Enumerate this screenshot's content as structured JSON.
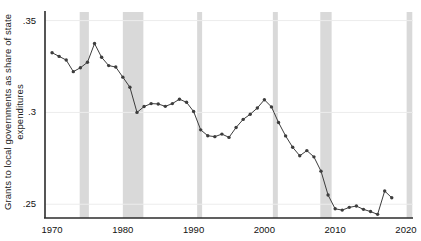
{
  "chart_data": {
    "type": "line",
    "title": "",
    "subtitle": "",
    "xlabel": "",
    "ylabel": "Grants to local governments as share of state expenditures",
    "xlim": [
      1969,
      2021
    ],
    "ylim": [
      0.2425,
      0.3525
    ],
    "grid": true,
    "legend_position": "none",
    "marker": "filled-circle",
    "line_style": "solid",
    "series_color": "#3d3d3d",
    "recession_band_color": "#d9d9d9",
    "xticks": [
      "1970",
      "1980",
      "1990",
      "2000",
      "2010",
      "2020"
    ],
    "xtick_values": [
      1970,
      1980,
      1990,
      2000,
      2010,
      2020
    ],
    "yticks": [
      ".35",
      ".3",
      ".25"
    ],
    "ytick_values": [
      0.35,
      0.3,
      0.25
    ],
    "x": [
      1970,
      1971,
      1972,
      1973,
      1974,
      1975,
      1976,
      1977,
      1978,
      1979,
      1980,
      1981,
      1982,
      1983,
      1984,
      1985,
      1986,
      1987,
      1988,
      1989,
      1990,
      1991,
      1992,
      1993,
      1994,
      1995,
      1996,
      1997,
      1998,
      1999,
      2000,
      2001,
      2002,
      2003,
      2004,
      2005,
      2006,
      2007,
      2008,
      2009,
      2010,
      2011,
      2012,
      2013,
      2014,
      2015,
      2016,
      2017,
      2018
    ],
    "values": [
      0.3325,
      0.3305,
      0.3285,
      0.3222,
      0.3243,
      0.3273,
      0.3375,
      0.33,
      0.3255,
      0.3247,
      0.3192,
      0.3137,
      0.3,
      0.3032,
      0.3048,
      0.3046,
      0.3033,
      0.3048,
      0.3072,
      0.3055,
      0.3005,
      0.2905,
      0.2873,
      0.2868,
      0.2882,
      0.2864,
      0.2918,
      0.2962,
      0.299,
      0.3024,
      0.3069,
      0.303,
      0.2945,
      0.2872,
      0.281,
      0.2764,
      0.2792,
      0.2758,
      0.268,
      0.255,
      0.2475,
      0.2468,
      0.2483,
      0.249,
      0.2472,
      0.246,
      0.2445,
      0.2572,
      0.2535
    ],
    "recession_bands": [
      {
        "start": 1973.9,
        "end": 1975.2
      },
      {
        "start": 1980.0,
        "end": 1982.9
      },
      {
        "start": 1990.5,
        "end": 1991.2
      },
      {
        "start": 2001.2,
        "end": 2001.9
      },
      {
        "start": 2007.9,
        "end": 2009.5
      },
      {
        "start": 2020.1,
        "end": 2020.9
      }
    ]
  }
}
